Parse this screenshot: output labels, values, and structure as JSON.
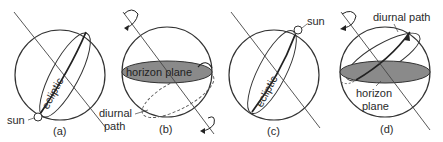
{
  "panels": [
    {
      "id": "a",
      "caption": "(a)",
      "labels": {
        "ecliptic": "ecliptic",
        "sun": "sun",
        "diurnal": "diurnal",
        "path": "path"
      }
    },
    {
      "id": "b",
      "caption": "(b)",
      "labels": {
        "horizon_plane": "horizon plane",
        "diurnal": "diurnal",
        "path": "path"
      }
    },
    {
      "id": "c",
      "caption": "(c)",
      "labels": {
        "ecliptic": "ecliptic",
        "sun": "sun"
      }
    },
    {
      "id": "d",
      "caption": "(d)",
      "labels": {
        "diurnal_path": "diurnal path",
        "horizon": "horizon",
        "plane": "plane"
      }
    }
  ],
  "colors": {
    "line": "#333333",
    "horizon_fill": "#8a8a8a",
    "sun_fill": "#ffffff"
  }
}
